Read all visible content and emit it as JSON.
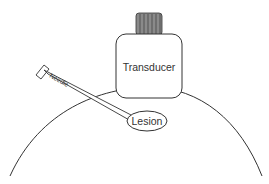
{
  "diagram": {
    "labels": {
      "transducer": "Transducer",
      "needle": "Needle",
      "lesion": "Lesion"
    },
    "colors": {
      "stroke": "#333333",
      "knob_fill": "#888888",
      "background": "#ffffff"
    }
  }
}
